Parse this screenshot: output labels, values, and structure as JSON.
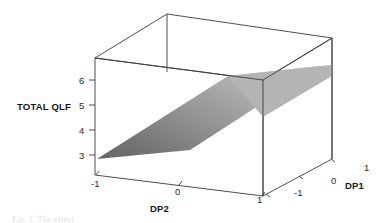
{
  "figure": {
    "type": "3d-surface-plot",
    "background": "#ffffff",
    "line_color": "#333333",
    "caption_fragment": "Fig. 1. The effect"
  },
  "chart_data": {
    "type": "surface",
    "title": "",
    "xlabel": "DP2",
    "ylabel": "TOTAL QLF",
    "zlabel": "DP1",
    "grid": false,
    "legend": "none",
    "projection": "3d-box-wireframe",
    "x": [
      -1,
      0,
      1
    ],
    "z": [
      -1,
      0,
      1
    ],
    "xticks": [
      "-1",
      "0",
      "1"
    ],
    "zticks": [
      "-1",
      "0",
      "1"
    ],
    "yticks": [
      "3",
      "4",
      "5",
      "6"
    ],
    "ylim": [
      2.5,
      6.5
    ],
    "xlim": [
      -1,
      1
    ],
    "zlim": [
      -1,
      1
    ],
    "surface_description": "Planar response surface rising with DP2 and slightly with DP1",
    "surface_shading": {
      "low_color": "#676767",
      "high_color": "#bdbdbd",
      "direction": "dark at low DP2 / light at high DP2"
    },
    "series": [
      {
        "name": "TOTAL QLF",
        "values": [
          [
            3.1,
            3.3,
            3.5
          ],
          [
            4.6,
            4.8,
            5.0
          ],
          [
            6.1,
            6.3,
            6.5
          ]
        ],
        "rows_are": "DP2 = -1, 0, 1",
        "cols_are": "DP1 = -1, 0, 1"
      }
    ]
  },
  "labels": {
    "y_axis_title": "TOTAL QLF",
    "x_axis_title": "DP2",
    "z_axis_title": "DP1",
    "y_ticks": [
      {
        "text": "6",
        "left": 79,
        "top": 75
      },
      {
        "text": "5",
        "left": 79,
        "top": 100
      },
      {
        "text": "4",
        "left": 79,
        "top": 125
      },
      {
        "text": "3",
        "left": 79,
        "top": 150
      }
    ],
    "x_ticks": [
      {
        "text": "-1",
        "left": 91,
        "top": 178
      },
      {
        "text": "0",
        "left": 175,
        "top": 186
      },
      {
        "text": "1",
        "left": 257,
        "top": 194
      }
    ],
    "z_ticks": [
      {
        "text": "-1",
        "left": 294,
        "top": 187
      },
      {
        "text": "0",
        "left": 331,
        "top": 175
      },
      {
        "text": "1",
        "left": 364,
        "top": 162
      }
    ]
  }
}
